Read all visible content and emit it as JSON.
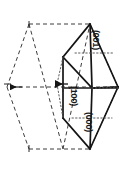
{
  "figure": {
    "name": "crystal-unit-cell-diagram",
    "type": "line-diagram",
    "background_color": "#ffffff",
    "line_color": "#151515",
    "dashed_color": "#444444",
    "dotted_color": "#666666"
  },
  "labels": {
    "top_plane": "(001)",
    "middle_plane": "(100)",
    "bottom_plane": "(000)"
  },
  "label_orientation": "rotated-90-clockwise",
  "geometry": {
    "solid_cell": {
      "description": "3D parallelepiped drawn with solid lines on the right side",
      "front_face_top": [
        [
          64,
          22
        ],
        [
          105,
          22
        ],
        [
          105,
          86
        ],
        [
          64,
          86
        ]
      ],
      "front_face_bottom": [
        [
          64,
          86
        ],
        [
          105,
          86
        ],
        [
          105,
          150
        ],
        [
          64,
          150
        ]
      ]
    },
    "dashed_outline": {
      "description": "hexagonal projection drawn with dashed lines on the left side",
      "vertices": [
        [
          23,
          25
        ],
        [
          88,
          25
        ],
        [
          118,
          86
        ],
        [
          88,
          150
        ],
        [
          23,
          150
        ],
        [
          7,
          86
        ]
      ]
    },
    "dotted_lines": {
      "description": "internal construction lines shown dotted",
      "count": 3
    },
    "arrows": [
      {
        "name": "left-vector-arrow",
        "direction": "left",
        "at": [
          8,
          86
        ]
      },
      {
        "name": "center-vector-arrow",
        "direction": "left",
        "at": [
          56,
          84
        ]
      }
    ]
  }
}
